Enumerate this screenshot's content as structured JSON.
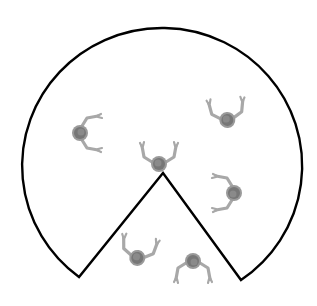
{
  "diagram": {
    "shape": "circular room with wedge cut-out at bottom (pac-man shape)",
    "stroke_color": "#000000",
    "figure_color": "#9a9a9a",
    "head_color": "#6f6f6f",
    "figures": [
      {
        "id": "left",
        "x": 84,
        "y": 133,
        "rotation": 90
      },
      {
        "id": "center",
        "x": 159,
        "y": 160,
        "rotation": 0
      },
      {
        "id": "upper-right",
        "x": 227,
        "y": 116,
        "rotation": -5
      },
      {
        "id": "right",
        "x": 230,
        "y": 193,
        "rotation": -90
      },
      {
        "id": "bottom-left",
        "x": 138,
        "y": 254,
        "rotation": 10
      },
      {
        "id": "bottom-right",
        "x": 193,
        "y": 265,
        "rotation": 180
      }
    ]
  }
}
